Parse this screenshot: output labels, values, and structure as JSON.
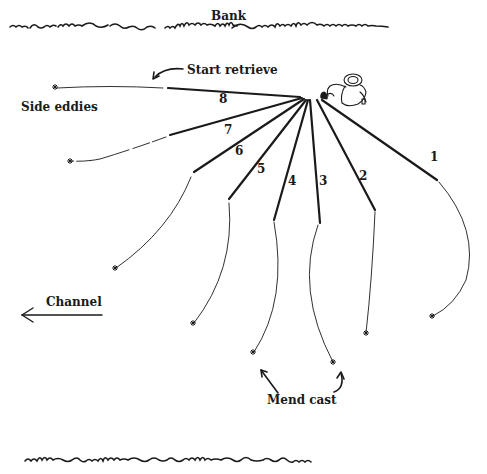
{
  "labels": {
    "bank_top": "Bank",
    "start_retrieve": "Start retrieve",
    "side_eddies": "Side eddies",
    "channel": "Channel",
    "mend_cast": "Mend cast"
  },
  "casts": [
    {
      "number": "1"
    },
    {
      "number": "2"
    },
    {
      "number": "3"
    },
    {
      "number": "4"
    },
    {
      "number": "5"
    },
    {
      "number": "6"
    },
    {
      "number": "7"
    },
    {
      "number": "8"
    }
  ],
  "figure": {
    "icon": "angler-icon"
  },
  "colors": {
    "ink": "#1a1a1a",
    "background": "#ffffff"
  }
}
